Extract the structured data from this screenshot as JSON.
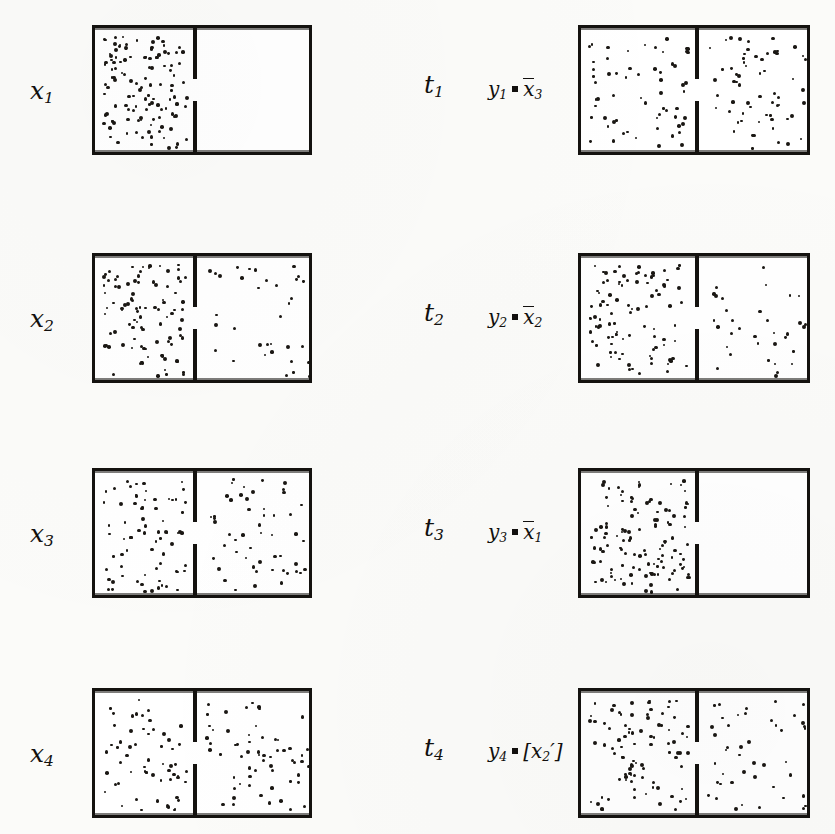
{
  "figure": {
    "type": "diagram",
    "background_color": "#fbfbf9",
    "ink_color": "#14120f"
  },
  "rows": [
    {
      "left_label": "x",
      "left_sub": "1",
      "mid_label": "t",
      "mid_sub": "1",
      "right_label_lhs": "y",
      "right_label_lhs_sub": "1",
      "right_label_rel": "=",
      "right_label_rhs": "x",
      "right_label_rhs_sub": "3",
      "right_label_overbar": true,
      "right_label_bracketed": false,
      "right_label_prime": false,
      "left_box": {
        "left_dots": 120,
        "right_dots": 0
      },
      "right_box": {
        "left_dots": 62,
        "right_dots": 62
      }
    },
    {
      "left_label": "x",
      "left_sub": "2",
      "mid_label": "t",
      "mid_sub": "2",
      "right_label_lhs": "y",
      "right_label_lhs_sub": "2",
      "right_label_rel": "=",
      "right_label_rhs": "x",
      "right_label_rhs_sub": "2",
      "right_label_overbar": true,
      "right_label_bracketed": false,
      "right_label_prime": false,
      "left_box": {
        "left_dots": 95,
        "right_dots": 34
      },
      "right_box": {
        "left_dots": 95,
        "right_dots": 34
      }
    },
    {
      "left_label": "x",
      "left_sub": "3",
      "mid_label": "t",
      "mid_sub": "3",
      "right_label_lhs": "y",
      "right_label_lhs_sub": "3",
      "right_label_rel": "=",
      "right_label_rhs": "x",
      "right_label_rhs_sub": "1",
      "right_label_overbar": true,
      "right_label_bracketed": false,
      "right_label_prime": false,
      "left_box": {
        "left_dots": 72,
        "right_dots": 52
      },
      "right_box": {
        "left_dots": 120,
        "right_dots": 0
      }
    },
    {
      "left_label": "x",
      "left_sub": "4",
      "mid_label": "t",
      "mid_sub": "4",
      "right_label_lhs": "y",
      "right_label_lhs_sub": "4",
      "right_label_rel": "=",
      "right_label_rhs": "x",
      "right_label_rhs_sub": "2",
      "right_label_overbar": false,
      "right_label_bracketed": true,
      "right_label_prime": true,
      "left_box": {
        "left_dots": 60,
        "right_dots": 60
      },
      "right_box": {
        "left_dots": 88,
        "right_dots": 44
      }
    }
  ],
  "geometry": {
    "left_column": {
      "box_x": 92,
      "box_w": 220,
      "divider_frac": 0.455
    },
    "right_column": {
      "box_x": 578,
      "box_w": 232,
      "divider_frac": 0.5
    },
    "row_tops": [
      25,
      253,
      468,
      688
    ],
    "box_h": 130,
    "aperture_gap": 28,
    "label_x": {
      "left": 30,
      "mid": 424,
      "right": 486
    }
  }
}
